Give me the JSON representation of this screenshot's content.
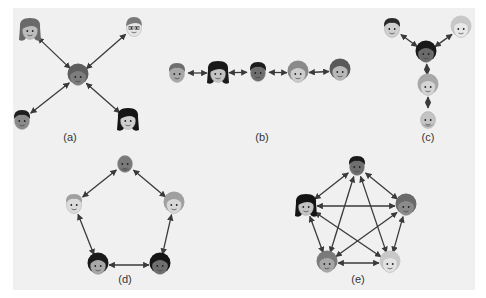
{
  "figure": {
    "background": "#f0f0f0",
    "edge_color": "#3a3a3a",
    "panels": [
      {
        "id": "a",
        "label": "(a)",
        "topology": "star",
        "label_pos": [
          70,
          141
        ],
        "nodes": [
          {
            "id": "a1",
            "x": 30,
            "y": 30,
            "skin": "#bdbdbd",
            "hair": "#6a6a6a",
            "style": "long"
          },
          {
            "id": "a2",
            "x": 134,
            "y": 27,
            "skin": "#e6e6e6",
            "hair": "#7a7a7a",
            "style": "glasses"
          },
          {
            "id": "a3",
            "x": 78,
            "y": 76,
            "skin": "#7d7d7d",
            "hair": "#5e5e5e",
            "style": "curly"
          },
          {
            "id": "a4",
            "x": 22,
            "y": 120,
            "skin": "#8a8a8a",
            "hair": "#1e1e1e",
            "style": "short"
          },
          {
            "id": "a5",
            "x": 128,
            "y": 120,
            "skin": "#cfcfcf",
            "hair": "#151515",
            "style": "long"
          }
        ],
        "edges": [
          [
            "a1",
            "a3"
          ],
          [
            "a2",
            "a3"
          ],
          [
            "a4",
            "a3"
          ],
          [
            "a5",
            "a3"
          ]
        ]
      },
      {
        "id": "b",
        "label": "(b)",
        "topology": "chain",
        "label_pos": [
          262,
          141
        ],
        "nodes": [
          {
            "id": "b1",
            "x": 177,
            "y": 73,
            "skin": "#a8a8a8",
            "hair": "#6e6e6e",
            "style": "short"
          },
          {
            "id": "b2",
            "x": 218,
            "y": 73,
            "skin": "#c2c2c2",
            "hair": "#1a1a1a",
            "style": "long"
          },
          {
            "id": "b3",
            "x": 258,
            "y": 72,
            "skin": "#6e6e6e",
            "hair": "#1c1c1c",
            "style": "short"
          },
          {
            "id": "b4",
            "x": 298,
            "y": 73,
            "skin": "#cdcdcd",
            "hair": "#8a8a8a",
            "style": "curly"
          },
          {
            "id": "b5",
            "x": 340,
            "y": 71,
            "skin": "#b8b8b8",
            "hair": "#5a5a5a",
            "style": "curly"
          }
        ],
        "edges": [
          [
            "b1",
            "b2"
          ],
          [
            "b2",
            "b3"
          ],
          [
            "b3",
            "b4"
          ],
          [
            "b4",
            "b5"
          ]
        ]
      },
      {
        "id": "c",
        "label": "(c)",
        "topology": "tree",
        "label_pos": [
          428,
          141
        ],
        "nodes": [
          {
            "id": "c1",
            "x": 392,
            "y": 28,
            "skin": "#cfcfcf",
            "hair": "#2a2a2a",
            "style": "short"
          },
          {
            "id": "c2",
            "x": 461,
            "y": 28,
            "skin": "#e8e8e8",
            "hair": "#c8c8c8",
            "style": "curly"
          },
          {
            "id": "c3",
            "x": 426,
            "y": 53,
            "skin": "#6a6a6a",
            "hair": "#1a1a1a",
            "style": "curly"
          },
          {
            "id": "c4",
            "x": 428,
            "y": 86,
            "skin": "#d5d5d5",
            "hair": "#a8a8a8",
            "style": "curly"
          },
          {
            "id": "c5",
            "x": 428,
            "y": 119,
            "skin": "#c4c4c4",
            "hair": "#8a8a8a",
            "style": "bald"
          }
        ],
        "edges": [
          [
            "c1",
            "c3"
          ],
          [
            "c2",
            "c3"
          ],
          [
            "c3",
            "c4"
          ],
          [
            "c4",
            "c5"
          ]
        ]
      },
      {
        "id": "d",
        "label": "(d)",
        "topology": "circle",
        "label_pos": [
          125,
          283
        ],
        "nodes": [
          {
            "id": "d1",
            "x": 125,
            "y": 163,
            "skin": "#7a7a7a",
            "hair": "#5a5a5a",
            "style": "bald"
          },
          {
            "id": "d2",
            "x": 74,
            "y": 204,
            "skin": "#dcdcdc",
            "hair": "#a0a0a0",
            "style": "short"
          },
          {
            "id": "d3",
            "x": 174,
            "y": 204,
            "skin": "#d8d8d8",
            "hair": "#a0a0a0",
            "style": "curly"
          },
          {
            "id": "d4",
            "x": 98,
            "y": 265,
            "skin": "#a8a8a8",
            "hair": "#1a1a1a",
            "style": "curly"
          },
          {
            "id": "d5",
            "x": 160,
            "y": 265,
            "skin": "#6e6e6e",
            "hair": "#151515",
            "style": "curly"
          }
        ],
        "edges": [
          [
            "d1",
            "d2"
          ],
          [
            "d1",
            "d3"
          ],
          [
            "d2",
            "d4"
          ],
          [
            "d3",
            "d5"
          ],
          [
            "d4",
            "d5"
          ]
        ]
      },
      {
        "id": "e",
        "label": "(e)",
        "topology": "all-channel",
        "label_pos": [
          358,
          283
        ],
        "nodes": [
          {
            "id": "e1",
            "x": 357,
            "y": 166,
            "skin": "#6e6e6e",
            "hair": "#1a1a1a",
            "style": "short"
          },
          {
            "id": "e2",
            "x": 306,
            "y": 206,
            "skin": "#c4c4c4",
            "hair": "#141414",
            "style": "long"
          },
          {
            "id": "e3",
            "x": 406,
            "y": 206,
            "skin": "#8a8a8a",
            "hair": "#6a6a6a",
            "style": "curly"
          },
          {
            "id": "e4",
            "x": 327,
            "y": 263,
            "skin": "#a8a8a8",
            "hair": "#7a7a7a",
            "style": "curly"
          },
          {
            "id": "e5",
            "x": 390,
            "y": 263,
            "skin": "#e2e2e2",
            "hair": "#c8c8c8",
            "style": "curly"
          }
        ],
        "edges": [
          [
            "e1",
            "e2"
          ],
          [
            "e1",
            "e3"
          ],
          [
            "e1",
            "e4"
          ],
          [
            "e1",
            "e5"
          ],
          [
            "e2",
            "e3"
          ],
          [
            "e2",
            "e4"
          ],
          [
            "e2",
            "e5"
          ],
          [
            "e3",
            "e4"
          ],
          [
            "e3",
            "e5"
          ],
          [
            "e4",
            "e5"
          ]
        ]
      }
    ]
  }
}
